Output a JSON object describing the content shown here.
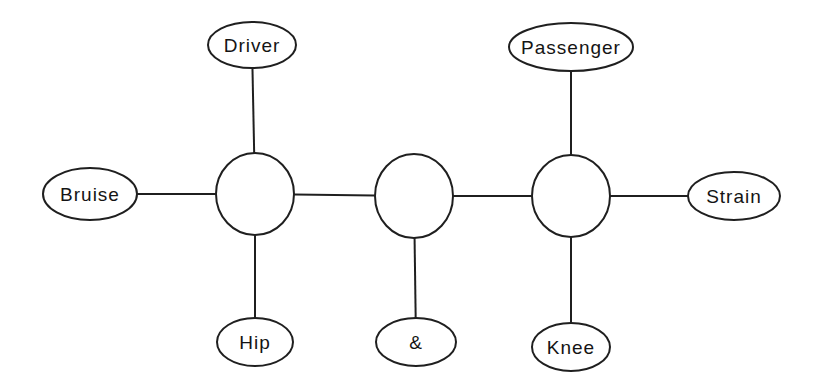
{
  "figure": {
    "background": "#ffffff",
    "stroke_color": "#1f1f1f",
    "text_color": "#141414",
    "stroke_width": 2,
    "nodes": [
      {
        "id": "driver",
        "shape": "ellipse",
        "label": "Driver",
        "cx": 252,
        "cy": 45,
        "rx": 44,
        "ry": 23
      },
      {
        "id": "passenger",
        "shape": "ellipse",
        "label": "Passenger",
        "cx": 571,
        "cy": 47,
        "rx": 62,
        "ry": 24
      },
      {
        "id": "bruise",
        "shape": "ellipse",
        "label": "Bruise",
        "cx": 90,
        "cy": 194,
        "rx": 47,
        "ry": 26
      },
      {
        "id": "clique-1",
        "shape": "circle",
        "label": "",
        "cx": 255,
        "cy": 194,
        "rx": 39,
        "ry": 41
      },
      {
        "id": "clique-2",
        "shape": "circle",
        "label": "",
        "cx": 414,
        "cy": 196,
        "rx": 39,
        "ry": 42
      },
      {
        "id": "clique-3",
        "shape": "circle",
        "label": "",
        "cx": 571,
        "cy": 196,
        "rx": 39,
        "ry": 41
      },
      {
        "id": "strain",
        "shape": "ellipse",
        "label": "Strain",
        "cx": 734,
        "cy": 196,
        "rx": 46,
        "ry": 24
      },
      {
        "id": "hip",
        "shape": "ellipse",
        "label": "Hip",
        "cx": 255,
        "cy": 342,
        "rx": 38,
        "ry": 24
      },
      {
        "id": "amp",
        "shape": "ellipse",
        "label": "&",
        "cx": 416,
        "cy": 342,
        "rx": 40,
        "ry": 24
      },
      {
        "id": "knee",
        "shape": "ellipse",
        "label": "Knee",
        "cx": 571,
        "cy": 347,
        "rx": 39,
        "ry": 24
      }
    ],
    "edges": [
      {
        "from": "driver",
        "to": "clique-1"
      },
      {
        "from": "bruise",
        "to": "clique-1"
      },
      {
        "from": "hip",
        "to": "clique-1"
      },
      {
        "from": "clique-1",
        "to": "clique-2"
      },
      {
        "from": "amp",
        "to": "clique-2"
      },
      {
        "from": "clique-2",
        "to": "clique-3"
      },
      {
        "from": "passenger",
        "to": "clique-3"
      },
      {
        "from": "strain",
        "to": "clique-3"
      },
      {
        "from": "knee",
        "to": "clique-3"
      }
    ]
  }
}
